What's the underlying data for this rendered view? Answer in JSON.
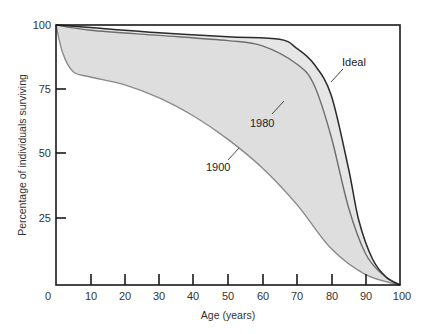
{
  "chart_data": {
    "type": "line",
    "title": "",
    "xlabel": "Age (years)",
    "ylabel": "Percentage of individuals surviving",
    "xlim": [
      0,
      100
    ],
    "ylim": [
      0,
      100
    ],
    "x_ticks": [
      0,
      10,
      20,
      30,
      40,
      50,
      60,
      70,
      80,
      90,
      100
    ],
    "y_ticks": [
      25,
      50,
      75,
      100
    ],
    "grid": false,
    "legend": "inline labels on curves",
    "fill": "shaded band between curves",
    "series": [
      {
        "name": "Ideal",
        "color": "#2b2b2b",
        "points": [
          [
            0,
            100
          ],
          [
            10,
            99
          ],
          [
            30,
            97
          ],
          [
            50,
            95.5
          ],
          [
            65,
            94.5
          ],
          [
            70,
            91
          ],
          [
            75,
            85
          ],
          [
            80,
            73
          ],
          [
            85,
            45
          ],
          [
            88,
            25
          ],
          [
            92,
            10
          ],
          [
            96,
            3
          ],
          [
            100,
            0
          ]
        ]
      },
      {
        "name": "1980",
        "color": "#6e6e6e",
        "points": [
          [
            0,
            100
          ],
          [
            10,
            98
          ],
          [
            30,
            96
          ],
          [
            50,
            94
          ],
          [
            60,
            92
          ],
          [
            70,
            85
          ],
          [
            75,
            77
          ],
          [
            80,
            57
          ],
          [
            85,
            30
          ],
          [
            90,
            12
          ],
          [
            95,
            4
          ],
          [
            100,
            0
          ]
        ]
      },
      {
        "name": "1900",
        "color": "#8a8a8a",
        "points": [
          [
            0,
            100
          ],
          [
            2,
            89
          ],
          [
            5,
            82
          ],
          [
            10,
            80
          ],
          [
            20,
            77
          ],
          [
            30,
            72
          ],
          [
            40,
            65
          ],
          [
            50,
            56
          ],
          [
            60,
            45
          ],
          [
            70,
            31
          ],
          [
            80,
            14
          ],
          [
            90,
            4
          ],
          [
            100,
            0
          ]
        ]
      }
    ],
    "annotations": [
      {
        "text": "Ideal",
        "x": 88,
        "y": 85
      },
      {
        "text": "1980",
        "x": 79,
        "y": 63
      },
      {
        "text": "1900",
        "x": 62,
        "y": 34
      }
    ]
  },
  "labels": {
    "xlabel": "Age (years)",
    "ylabel": "Percentage of individuals surviving",
    "ideal": "Ideal",
    "y1980": "1980",
    "y1900": "1900",
    "x0": "0",
    "x10": "10",
    "x20": "20",
    "x30": "30",
    "x40": "40",
    "x50": "50",
    "x60": "60",
    "x70": "70",
    "x80": "80",
    "x90": "90",
    "x100": "100",
    "y25": "25",
    "y50": "50",
    "y75": "75",
    "y100": "100"
  }
}
